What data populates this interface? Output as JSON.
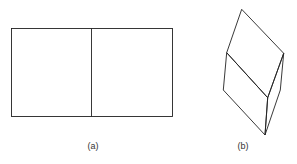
{
  "figure": {
    "panels": [
      {
        "id": "a",
        "label": "(a)",
        "description": "rectangle divided into two squares by a vertical line"
      },
      {
        "id": "b",
        "label": "(b)",
        "description": "folded rectangle shown in perspective along the middle crease"
      }
    ],
    "stroke_color": "#222222",
    "background": "#ffffff"
  }
}
